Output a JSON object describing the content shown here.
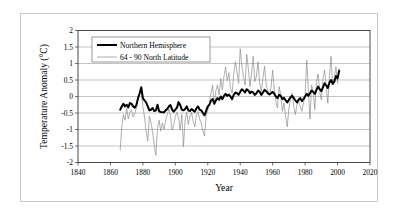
{
  "chart_data": {
    "type": "line",
    "title": "",
    "xlabel": "Year",
    "ylabel": "Temperature Anomaly (°C)",
    "xlim": [
      1840,
      2020
    ],
    "ylim": [
      -2,
      2
    ],
    "xticks": [
      1840,
      1860,
      1880,
      1900,
      1920,
      1940,
      1960,
      1980,
      2000,
      2020
    ],
    "yticks": [
      -2,
      -1.5,
      -1,
      -0.5,
      0,
      0.5,
      1,
      1.5,
      2
    ],
    "xtick_labels": [
      "1840",
      "1860",
      "1880",
      "1900",
      "1920",
      "1940",
      "1960",
      "1980",
      "2000",
      "2020"
    ],
    "ytick_labels": [
      "-2",
      "-1.5",
      "-1",
      "-0.5",
      "0",
      "0.5",
      "1",
      "1.5",
      "2"
    ],
    "grid": "horizontal",
    "legend_position": "upper-left-inside",
    "series": [
      {
        "name": "Northern Hemisphere",
        "color": "#000000",
        "width": 2.0,
        "x_start": 1866,
        "x_step": 1,
        "values": [
          -0.4,
          -0.3,
          -0.22,
          -0.3,
          -0.25,
          -0.33,
          -0.2,
          -0.22,
          -0.3,
          -0.34,
          -0.26,
          -0.05,
          0.1,
          0.28,
          -0.05,
          -0.12,
          -0.18,
          -0.3,
          -0.42,
          -0.4,
          -0.35,
          -0.44,
          -0.42,
          -0.25,
          -0.45,
          -0.47,
          -0.48,
          -0.48,
          -0.42,
          -0.38,
          -0.3,
          -0.26,
          -0.4,
          -0.46,
          -0.4,
          -0.34,
          -0.17,
          -0.26,
          -0.4,
          -0.42,
          -0.38,
          -0.3,
          -0.42,
          -0.44,
          -0.38,
          -0.42,
          -0.46,
          -0.36,
          -0.3,
          -0.4,
          -0.42,
          -0.5,
          -0.57,
          -0.43,
          -0.3,
          -0.25,
          -0.12,
          -0.08,
          -0.22,
          -0.12,
          -0.05,
          -0.1,
          0.0,
          -0.08,
          0.02,
          0.08,
          0.02,
          0.06,
          0.0,
          -0.08,
          0.05,
          0.12,
          0.1,
          0.05,
          0.14,
          0.22,
          0.18,
          0.12,
          0.22,
          0.18,
          0.1,
          0.15,
          0.12,
          0.05,
          0.1,
          0.18,
          0.14,
          0.05,
          0.12,
          0.2,
          0.16,
          0.1,
          0.06,
          0.1,
          0.14,
          0.08,
          0.0,
          -0.05,
          0.05,
          0.02,
          -0.08,
          -0.04,
          -0.12,
          -0.18,
          -0.1,
          -0.02,
          0.02,
          -0.05,
          -0.12,
          -0.18,
          -0.1,
          -0.05,
          -0.14,
          -0.08,
          0.0,
          0.08,
          0.02,
          0.1,
          0.18,
          0.14,
          0.08,
          0.2,
          0.3,
          0.22,
          0.16,
          0.28,
          0.4,
          0.34,
          0.26,
          0.42,
          0.5,
          0.38,
          0.45,
          0.62,
          0.55,
          0.78
        ]
      },
      {
        "name": "64 - 90 North Latitude",
        "color": "#8c8c8c",
        "width": 0.7,
        "x_start": 1866,
        "x_step": 1,
        "values": [
          -1.62,
          -0.92,
          -0.55,
          -0.72,
          -0.36,
          -0.68,
          -0.48,
          -0.4,
          -0.62,
          -0.5,
          -0.35,
          -0.05,
          0.08,
          0.18,
          -0.3,
          -0.62,
          -1.05,
          -1.35,
          -0.6,
          -0.78,
          -1.1,
          -1.45,
          -1.78,
          -0.95,
          -0.72,
          -1.05,
          -0.8,
          -1.0,
          -0.72,
          -0.55,
          -0.38,
          -0.58,
          -1.02,
          -0.86,
          -0.6,
          -0.48,
          -0.66,
          -1.02,
          -0.55,
          -1.52,
          -0.72,
          -0.48,
          -0.85,
          -0.6,
          -0.48,
          -0.75,
          -0.92,
          -0.55,
          -0.45,
          -0.68,
          -0.8,
          -1.05,
          -1.2,
          -0.58,
          -0.42,
          -0.2,
          0.12,
          0.34,
          -0.25,
          0.18,
          0.35,
          0.05,
          0.55,
          0.2,
          0.62,
          0.9,
          0.48,
          0.72,
          0.25,
          0.1,
          0.68,
          1.05,
          0.75,
          0.4,
          1.45,
          0.95,
          0.6,
          0.35,
          1.28,
          0.85,
          0.3,
          0.7,
          1.22,
          0.45,
          0.62,
          1.05,
          0.4,
          0.15,
          0.55,
          0.92,
          0.35,
          0.18,
          0.05,
          0.28,
          0.8,
          0.22,
          -0.15,
          -0.35,
          0.3,
          0.05,
          -0.45,
          -0.2,
          -0.6,
          -0.92,
          -0.35,
          -0.1,
          0.1,
          -0.3,
          -0.55,
          -0.25,
          -0.12,
          -0.3,
          -0.45,
          -0.2,
          0.05,
          1.1,
          0.2,
          -0.68,
          0.35,
          0.15,
          -0.4,
          0.45,
          0.68,
          0.15,
          -0.1,
          0.55,
          0.8,
          0.3,
          -0.2,
          0.62,
          1.22,
          0.35,
          0.55,
          0.9,
          0.4,
          0.85
        ]
      }
    ],
    "legend_entries": [
      {
        "label": "Northern Hemisphere",
        "color": "#000000",
        "width": 2.0
      },
      {
        "label": "64 - 90 North Latitude",
        "color": "#8c8c8c",
        "width": 0.7
      }
    ]
  }
}
